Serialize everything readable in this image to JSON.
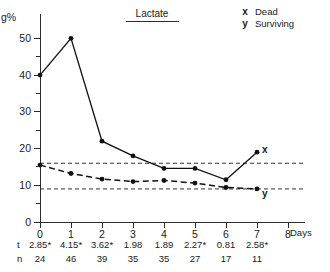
{
  "chart_data": {
    "type": "line",
    "title": "Lactate",
    "xlabel": "Days",
    "ylabel": "g%",
    "xlim": [
      0,
      8
    ],
    "ylim": [
      0,
      55
    ],
    "x": [
      0,
      1,
      2,
      3,
      4,
      5,
      6,
      7
    ],
    "xticks": [
      "0",
      "1",
      "2",
      "3",
      "4",
      "5",
      "6",
      "7",
      "8"
    ],
    "yticks": [
      "0",
      "10",
      "20",
      "30",
      "40",
      "50"
    ],
    "grid": false,
    "legend_position": "top-right",
    "series": [
      {
        "name": "Dead",
        "symbol": "x",
        "style": "solid",
        "values": [
          40,
          50,
          22,
          18,
          14.6,
          14.6,
          11.5,
          19
        ],
        "end_label": "x"
      },
      {
        "name": "Surviving",
        "symbol": "y",
        "style": "dashed",
        "values": [
          15.5,
          13.2,
          11.7,
          11,
          11.3,
          10.6,
          9.4,
          9
        ],
        "end_label": "y"
      }
    ],
    "reference_lines": [
      16,
      9
    ],
    "annotations": {
      "row_labels": [
        "t",
        "n"
      ],
      "t_values": [
        "2.85*",
        "4.15*",
        "3.62*",
        "1.98",
        "1.89",
        "2.27*",
        "0.81",
        "2.58*"
      ],
      "n_values": [
        "24",
        "46",
        "39",
        "35",
        "35",
        "27",
        "17",
        "11"
      ]
    }
  },
  "legend": {
    "entries": [
      {
        "symbol": "x",
        "label": "Dead"
      },
      {
        "symbol": "y",
        "label": "Surviving"
      }
    ]
  }
}
